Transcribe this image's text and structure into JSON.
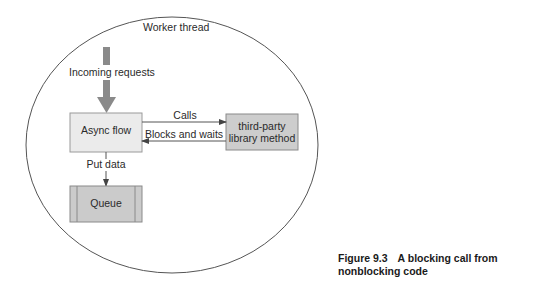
{
  "diagram": {
    "container": {
      "label": "Worker thread"
    },
    "incoming": {
      "label": "Incoming requests"
    },
    "nodes": {
      "async_flow": {
        "label": "Async flow"
      },
      "third_party": {
        "line1": "third-party",
        "line2": "library method"
      },
      "queue": {
        "label": "Queue"
      }
    },
    "edges": {
      "calls": {
        "label": "Calls"
      },
      "blocks": {
        "label": "Blocks and waits"
      },
      "put_data": {
        "label": "Put data"
      }
    },
    "colors": {
      "async_flow_fill": "#ebebeb",
      "third_party_fill": "#cdcdcd",
      "queue_fill": "#cbcbcb",
      "arrow_fill": "#8a8a8a",
      "stroke": "#555555"
    }
  },
  "caption": {
    "number": "Figure 9.3",
    "text": "A blocking call from nonblocking code"
  }
}
